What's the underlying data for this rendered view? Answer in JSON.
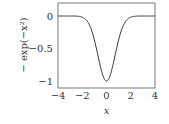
{
  "chart_data": {
    "type": "line",
    "title": "",
    "xlabel": "x",
    "ylabel": "− exp(−x²)",
    "xlim": [
      -4,
      4
    ],
    "ylim": [
      -1.1,
      0.1
    ],
    "xticks": [
      "−4",
      "−2",
      "0",
      "2",
      "4"
    ],
    "yticks": [
      "0",
      "−0.5",
      "−1"
    ],
    "grid": false,
    "legend": null,
    "series": [
      {
        "name": "-exp(-x^2)",
        "x": [
          -4,
          -3,
          -2.5,
          -2,
          -1.5,
          -1,
          -0.5,
          0,
          0.5,
          1,
          1.5,
          2,
          2.5,
          3,
          4
        ],
        "y": [
          0,
          -0.0001,
          -0.002,
          -0.018,
          -0.105,
          -0.368,
          -0.779,
          -1,
          -0.779,
          -0.368,
          -0.105,
          -0.018,
          -0.002,
          -0.0001,
          0
        ]
      }
    ],
    "line_color": "#333333"
  }
}
